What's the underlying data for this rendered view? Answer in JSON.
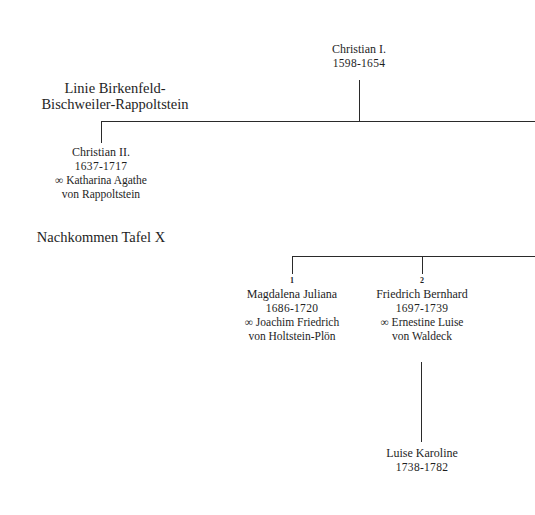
{
  "root": {
    "name": "Christian I.",
    "dates": "1598-1654"
  },
  "line_title": {
    "line1": "Linie Birkenfeld-",
    "line2": "Bischweiler-Rappoltstein"
  },
  "christian_ii": {
    "name": "Christian II.",
    "dates": "1637-1717",
    "spouse": "∞ Katharina Agathe",
    "spouse2": "von Rappoltstein"
  },
  "descendants_note": "Nachkommen Tafel X",
  "children": [
    {
      "number": "1",
      "name": "Magdalena Juliana",
      "dates": "1686-1720",
      "spouse": "∞ Joachim Friedrich",
      "spouse2": "von Holtstein-Plön"
    },
    {
      "number": "2",
      "name": "Friedrich Bernhard",
      "dates": "1697-1739",
      "spouse": "∞ Ernestine Luise",
      "spouse2": "von Waldeck"
    }
  ],
  "grandchild": {
    "name": "Luise Karoline",
    "dates": "1738-1782"
  }
}
